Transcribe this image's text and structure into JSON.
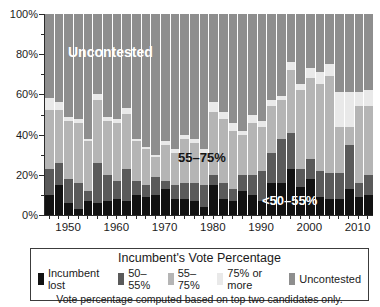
{
  "chart_data": {
    "type": "bar",
    "stacked": true,
    "title": "Incumbent's Vote Percentage",
    "xlabel": "",
    "ylabel": "",
    "ylim": [
      0,
      100
    ],
    "grid": false,
    "legend_position": "bottom-box",
    "years": [
      1946,
      1948,
      1950,
      1952,
      1954,
      1956,
      1958,
      1960,
      1962,
      1964,
      1966,
      1968,
      1970,
      1972,
      1974,
      1976,
      1978,
      1980,
      1982,
      1984,
      1986,
      1988,
      1990,
      1992,
      1994,
      1996,
      1998,
      2000,
      2002,
      2004,
      2006,
      2008,
      2010,
      2012
    ],
    "series": [
      {
        "name": "Incumbent lost",
        "color": "#121212",
        "values": [
          10,
          15,
          6,
          3,
          7,
          6,
          7,
          8,
          7,
          10,
          9,
          10,
          13,
          8,
          8,
          7,
          4,
          15,
          8,
          7,
          12,
          10,
          7,
          16,
          16,
          23,
          14,
          18,
          9,
          8,
          8,
          13,
          9,
          10
        ]
      },
      {
        "name": "50–55%",
        "color": "#5a5a5a",
        "values": [
          13,
          11,
          12,
          13,
          5,
          20,
          13,
          9,
          16,
          7,
          6,
          9,
          4,
          7,
          8,
          9,
          11,
          5,
          8,
          6,
          8,
          10,
          15,
          15,
          22,
          18,
          9,
          10,
          13,
          13,
          13,
          22,
          7,
          10
        ]
      },
      {
        "name": "55–75%",
        "color": "#b5b5b5",
        "values": [
          29,
          26,
          29,
          30,
          25,
          31,
          27,
          29,
          27,
          20,
          18,
          10,
          18,
          16,
          22,
          20,
          16,
          31,
          32,
          29,
          20,
          26,
          22,
          23,
          19,
          31,
          39,
          40,
          43,
          48,
          23,
          9,
          38,
          34
        ]
      },
      {
        "name": "75% or more",
        "color": "#e9e9e9",
        "values": [
          6,
          4,
          2,
          2,
          1,
          3,
          2,
          2,
          3,
          1,
          1,
          1,
          2,
          2,
          2,
          2,
          2,
          5,
          3,
          4,
          2,
          4,
          3,
          3,
          2,
          4,
          3,
          5,
          6,
          6,
          17,
          17,
          7,
          8
        ]
      },
      {
        "name": "Uncontested",
        "color": "#8e8e8e",
        "values": [
          42,
          44,
          51,
          52,
          62,
          40,
          51,
          52,
          47,
          62,
          66,
          70,
          63,
          67,
          60,
          62,
          67,
          44,
          49,
          54,
          58,
          50,
          53,
          43,
          41,
          24,
          35,
          27,
          29,
          25,
          39,
          39,
          39,
          38
        ]
      }
    ],
    "y_axis": {
      "tick_labels": [
        "0%",
        "20%",
        "40%",
        "60%",
        "80%",
        "100%"
      ],
      "major_step": 20,
      "minor_step": 10
    },
    "x_axis": {
      "label_years": [
        1950,
        1960,
        1970,
        1980,
        1990,
        2000,
        2010
      ],
      "tick_every_bar": true
    },
    "annotations": [
      {
        "text": "Uncontested",
        "x": 67,
        "y": 44,
        "color": "#ffffff",
        "size": 14
      },
      {
        "text": "55–75%",
        "x": 177,
        "y": 150,
        "color": "#141414",
        "size": 13
      },
      {
        "text": "<50–55%",
        "x": 261,
        "y": 193,
        "color": "#ffffff",
        "size": 13
      }
    ]
  },
  "legend": {
    "title": "Incumbent's Vote Percentage",
    "items": [
      {
        "label": "Incumbent lost",
        "color": "#121212"
      },
      {
        "label": "50–55%",
        "color": "#5a5a5a"
      },
      {
        "label": "55–75%",
        "color": "#b5b5b5"
      },
      {
        "label": "75% or more",
        "color": "#e9e9e9"
      },
      {
        "label": "Uncontested",
        "color": "#8e8e8e"
      }
    ],
    "footnote": "Vote percentage computed based on top two candidates only."
  }
}
